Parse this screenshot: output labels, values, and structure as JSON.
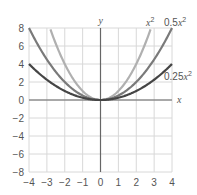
{
  "chart_data": {
    "type": "line",
    "title": "",
    "xlabel": "x",
    "ylabel": "y",
    "xlim": [
      -4,
      4
    ],
    "ylim": [
      -8,
      8
    ],
    "grid": true,
    "x_ticks": [
      -4,
      -3,
      -2,
      -1,
      0,
      1,
      2,
      3,
      4
    ],
    "y_ticks": [
      -8,
      -6,
      -4,
      -2,
      0,
      2,
      4,
      6,
      8
    ],
    "x_tick_labels": [
      "−4",
      "−3",
      "−2",
      "−1",
      "0",
      "1",
      "2",
      "3",
      "4"
    ],
    "y_tick_labels": [
      "−8",
      "−6",
      "−4",
      "−2",
      "0",
      "2",
      "4",
      "6",
      "8"
    ],
    "series": [
      {
        "name": "x^2",
        "label_base": "x",
        "label_exp": "2",
        "coef": 1.0,
        "color": "#b0b0b0",
        "x": [
          -2.83,
          -2,
          -1,
          0,
          1,
          2,
          2.83
        ],
        "values": [
          8,
          4,
          1,
          0,
          1,
          4,
          8
        ]
      },
      {
        "name": "0.5x^2",
        "label_base": "0.5x",
        "label_exp": "2",
        "coef": 0.5,
        "color": "#7a7a7a",
        "x": [
          -4,
          -3,
          -2,
          -1,
          0,
          1,
          2,
          3,
          4
        ],
        "values": [
          8,
          4.5,
          2,
          0.5,
          0,
          0.5,
          2,
          4.5,
          8
        ]
      },
      {
        "name": "0.25x^2",
        "label_base": "0.25x",
        "label_exp": "2",
        "coef": 0.25,
        "color": "#454545",
        "x": [
          -4,
          -3,
          -2,
          -1,
          0,
          1,
          2,
          3,
          4
        ],
        "values": [
          4,
          2.25,
          1,
          0.25,
          0,
          0.25,
          1,
          2.25,
          4
        ]
      }
    ],
    "legend": "inline labels at curve ends (top-right)"
  }
}
